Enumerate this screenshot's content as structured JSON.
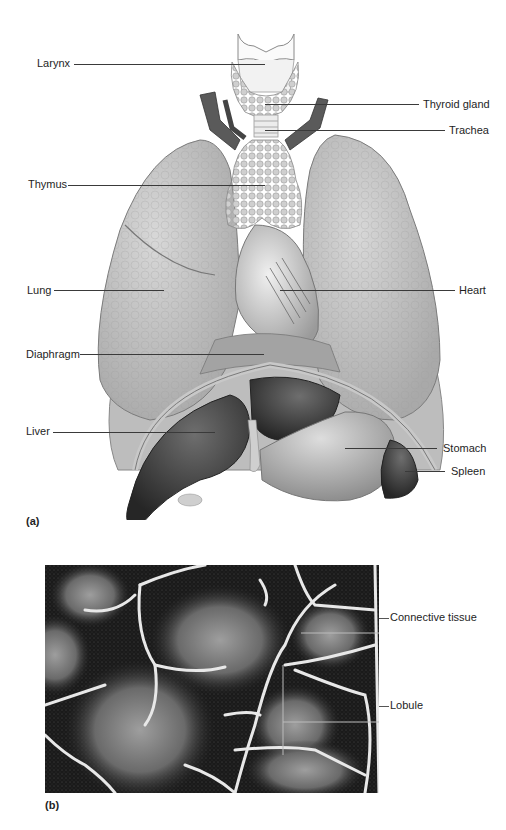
{
  "figure": {
    "panel_a": {
      "letter": "(a)",
      "labels": {
        "larynx": "Larynx",
        "thyroid": "Thyroid gland",
        "trachea": "Trachea",
        "thymus": "Thymus",
        "lung": "Lung",
        "heart": "Heart",
        "diaphragm": "Diaphragm",
        "liver": "Liver",
        "stomach": "Stomach",
        "spleen": "Spleen"
      }
    },
    "panel_b": {
      "letter": "(b)",
      "labels": {
        "connective": "Connective tissue",
        "lobule": "Lobule"
      }
    }
  }
}
